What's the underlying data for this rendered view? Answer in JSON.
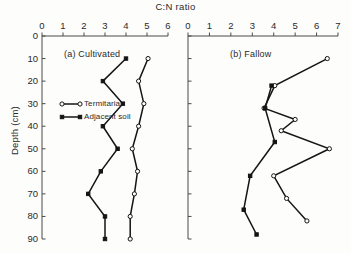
{
  "chart_data": {
    "type": "line",
    "title": "C:N ratio",
    "xlabel": "C:N ratio",
    "ylabel": "Depth (cm)",
    "orientation": "depth-profile-y-inverted",
    "grid": false,
    "legend_position": "inside-left-panel",
    "legend": [
      {
        "name": "Termitaria",
        "marker": "open-circle"
      },
      {
        "name": "Adjacent soil",
        "marker": "filled-square"
      }
    ],
    "ylim": [
      0,
      90
    ],
    "yticks": [
      0,
      10,
      20,
      30,
      40,
      50,
      60,
      70,
      80,
      90
    ],
    "ytick_labels": [
      "0",
      "10",
      "20",
      "30",
      "40",
      "50",
      "60",
      "70",
      "80",
      "90"
    ],
    "panels": [
      {
        "key": "cultivated",
        "label": "(a) Cultivated",
        "xlim": [
          0,
          6
        ],
        "xticks": [
          0,
          1,
          2,
          3,
          4,
          5,
          6
        ],
        "xtick_labels": [
          "0",
          "1",
          "2",
          "3",
          "4",
          "5",
          "6"
        ],
        "series": [
          {
            "name": "Termitaria",
            "marker": "open-circle",
            "depth": [
              10,
              20,
              30,
              40,
              50,
              60,
              70,
              80,
              90
            ],
            "values": [
              5.05,
              4.6,
              4.85,
              4.6,
              4.3,
              4.55,
              4.4,
              4.2,
              4.2
            ]
          },
          {
            "name": "Adjacent soil",
            "marker": "filled-square",
            "depth": [
              10,
              20,
              30,
              40,
              50,
              60,
              70,
              80,
              90
            ],
            "values": [
              4.0,
              2.9,
              3.85,
              2.9,
              3.6,
              2.8,
              2.2,
              3.0,
              3.0
            ]
          }
        ]
      },
      {
        "key": "fallow",
        "label": "(b) Fallow",
        "xlim": [
          0,
          7
        ],
        "xticks": [
          0,
          1,
          2,
          3,
          4,
          5,
          6,
          7
        ],
        "xtick_labels": [
          "0",
          "1",
          "2",
          "3",
          "4",
          "5",
          "6",
          "7"
        ],
        "series": [
          {
            "name": "Termitaria",
            "marker": "open-circle",
            "depth": [
              10,
              22,
              32,
              37,
              42,
              50,
              62,
              72,
              82
            ],
            "values": [
              6.5,
              4.05,
              3.55,
              5.0,
              4.35,
              6.6,
              4.0,
              4.6,
              5.55
            ]
          },
          {
            "name": "Adjacent soil",
            "marker": "filled-square",
            "depth": [
              22,
              32,
              47,
              62,
              77,
              88
            ],
            "values": [
              3.9,
              3.6,
              4.05,
              2.9,
              2.6,
              3.2
            ]
          }
        ]
      }
    ]
  }
}
